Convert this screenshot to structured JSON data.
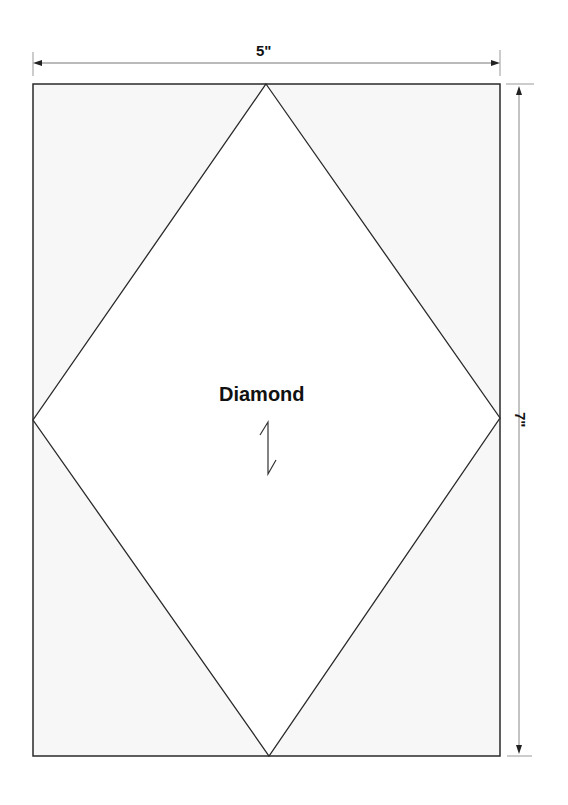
{
  "diagram": {
    "shape_label": "Diamond",
    "width_label": "5\"",
    "height_label": "7\"",
    "grain_arrow_icon": "grain-line-zigzag",
    "colors": {
      "line": "#2a2a2a",
      "corner_fill": "#f7f7f7",
      "diamond_fill": "#ffffff",
      "dimension_line": "#888888"
    }
  }
}
